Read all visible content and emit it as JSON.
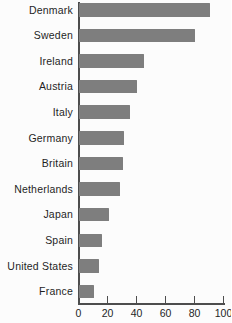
{
  "chart_data": {
    "type": "bar",
    "orientation": "horizontal",
    "title": "",
    "xlabel": "",
    "ylabel": "",
    "categories": [
      "Denmark",
      "Sweden",
      "Ireland",
      "Austria",
      "Italy",
      "Germany",
      "Britain",
      "Netherlands",
      "Japan",
      "Spain",
      "United States",
      "France"
    ],
    "values": [
      90,
      80,
      45,
      40,
      35,
      31,
      30,
      28,
      21,
      16,
      14,
      10
    ],
    "xlim": [
      0,
      100
    ],
    "xticks": [
      "0",
      "20",
      "40",
      "60",
      "80",
      "100"
    ],
    "xtick_values": [
      0,
      20,
      40,
      60,
      80,
      100
    ],
    "grid": false,
    "legend": null,
    "colors": {
      "bar": "#7e7e7e",
      "axis": "#4d4d4d",
      "text": "#1f1f1f",
      "background": "#fcfcfc"
    }
  }
}
